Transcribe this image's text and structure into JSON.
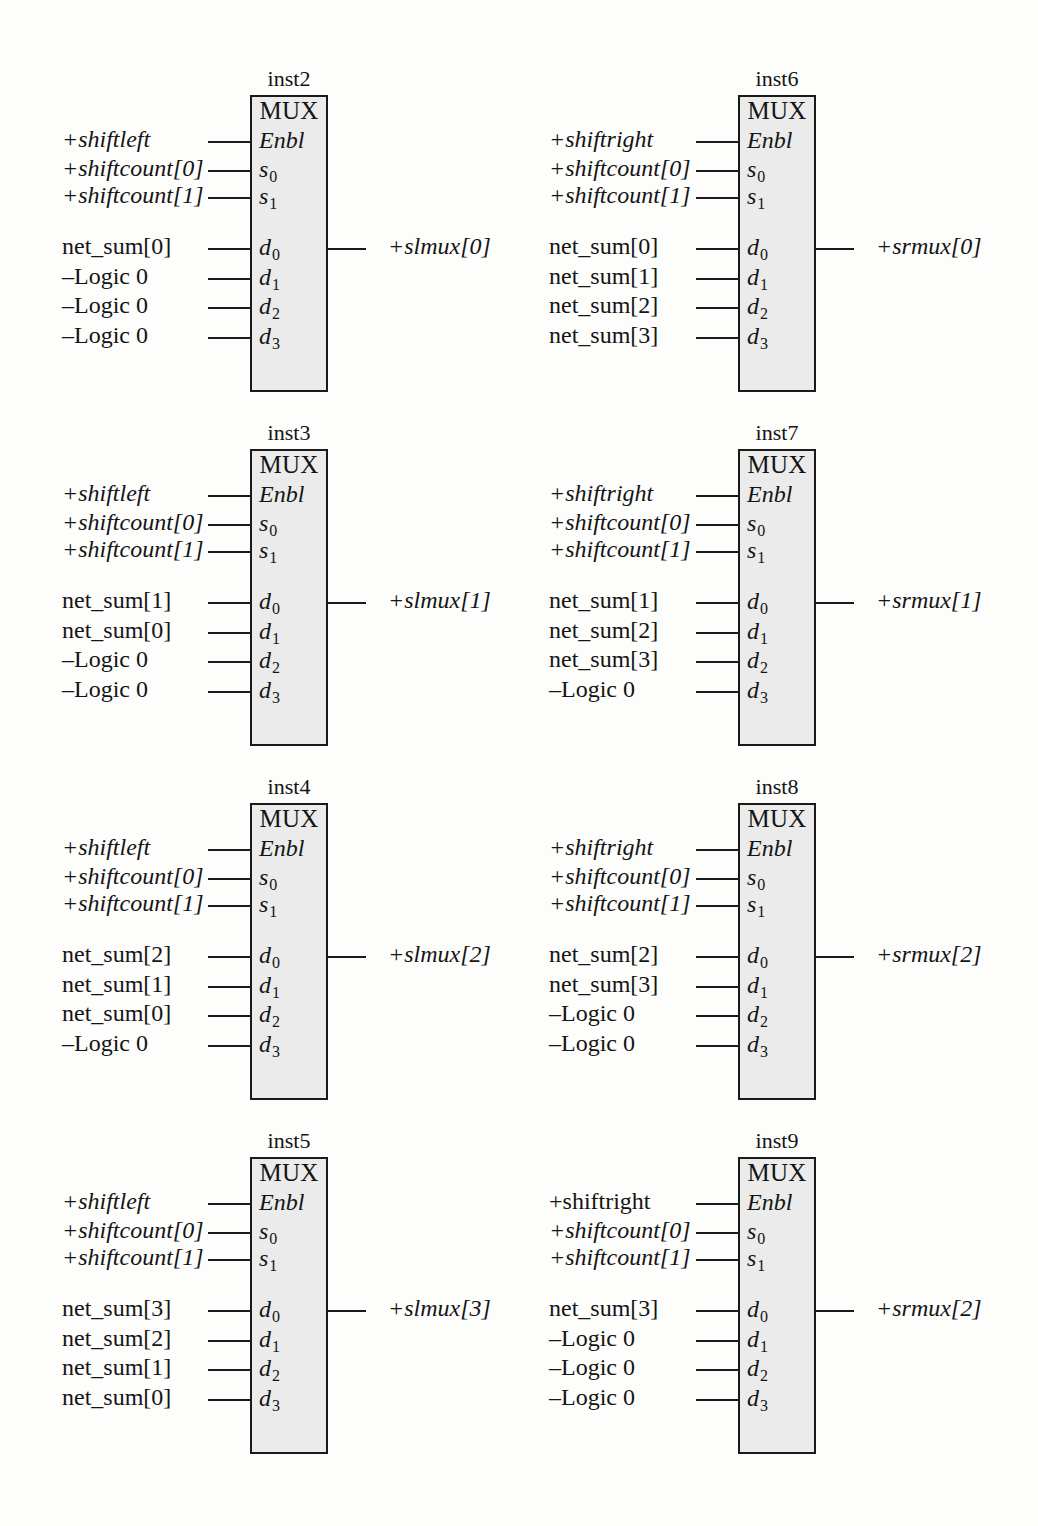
{
  "diagram": {
    "block_label": "MUX",
    "pin_names": {
      "enbl": "Enbl",
      "s0": "s",
      "s0_sub": "0",
      "s1": "s",
      "s1_sub": "1",
      "d0": "d",
      "d0_sub": "0",
      "d1": "d",
      "d1_sub": "1",
      "d2": "d",
      "d2_sub": "2",
      "d3": "d",
      "d3_sub": "3"
    },
    "colors": {
      "box_fill": "#ebebeb",
      "line": "#1a1a1a",
      "text": "#141414",
      "page_bg": "#fdfdfc"
    },
    "blocks": [
      {
        "id": "inst2",
        "instance": "inst2",
        "column": "left",
        "row": 0,
        "inputs": [
          {
            "pin": "Enbl",
            "label": "+shiftleft",
            "italic": true
          },
          {
            "pin": "s0",
            "label": "+shiftcount[0]",
            "italic": true
          },
          {
            "pin": "s1",
            "label": "+shiftcount[1]",
            "italic": true
          },
          {
            "pin": "d0",
            "label": "net_sum[0]",
            "italic": false
          },
          {
            "pin": "d1",
            "label": "–Logic 0",
            "italic": false
          },
          {
            "pin": "d2",
            "label": "–Logic 0",
            "italic": false
          },
          {
            "pin": "d3",
            "label": "–Logic 0",
            "italic": false
          }
        ],
        "output": "+slmux[0]"
      },
      {
        "id": "inst6",
        "instance": "inst6",
        "column": "right",
        "row": 0,
        "inputs": [
          {
            "pin": "Enbl",
            "label": "+shiftright",
            "italic": true
          },
          {
            "pin": "s0",
            "label": "+shiftcount[0]",
            "italic": true
          },
          {
            "pin": "s1",
            "label": "+shiftcount[1]",
            "italic": true
          },
          {
            "pin": "d0",
            "label": "net_sum[0]",
            "italic": false
          },
          {
            "pin": "d1",
            "label": "net_sum[1]",
            "italic": false
          },
          {
            "pin": "d2",
            "label": "net_sum[2]",
            "italic": false
          },
          {
            "pin": "d3",
            "label": "net_sum[3]",
            "italic": false
          }
        ],
        "output": "+srmux[0]"
      },
      {
        "id": "inst3",
        "instance": "inst3",
        "column": "left",
        "row": 1,
        "inputs": [
          {
            "pin": "Enbl",
            "label": "+shiftleft",
            "italic": true
          },
          {
            "pin": "s0",
            "label": "+shiftcount[0]",
            "italic": true
          },
          {
            "pin": "s1",
            "label": "+shiftcount[1]",
            "italic": true
          },
          {
            "pin": "d0",
            "label": "net_sum[1]",
            "italic": false
          },
          {
            "pin": "d1",
            "label": "net_sum[0]",
            "italic": false
          },
          {
            "pin": "d2",
            "label": "–Logic 0",
            "italic": false
          },
          {
            "pin": "d3",
            "label": "–Logic 0",
            "italic": false
          }
        ],
        "output": "+slmux[1]"
      },
      {
        "id": "inst7",
        "instance": "inst7",
        "column": "right",
        "row": 1,
        "inputs": [
          {
            "pin": "Enbl",
            "label": "+shiftright",
            "italic": true
          },
          {
            "pin": "s0",
            "label": "+shiftcount[0]",
            "italic": true
          },
          {
            "pin": "s1",
            "label": "+shiftcount[1]",
            "italic": true
          },
          {
            "pin": "d0",
            "label": "net_sum[1]",
            "italic": false
          },
          {
            "pin": "d1",
            "label": "net_sum[2]",
            "italic": false
          },
          {
            "pin": "d2",
            "label": "net_sum[3]",
            "italic": false
          },
          {
            "pin": "d3",
            "label": "–Logic 0",
            "italic": false
          }
        ],
        "output": "+srmux[1]"
      },
      {
        "id": "inst4",
        "instance": "inst4",
        "column": "left",
        "row": 2,
        "inputs": [
          {
            "pin": "Enbl",
            "label": "+shiftleft",
            "italic": true
          },
          {
            "pin": "s0",
            "label": "+shiftcount[0]",
            "italic": true
          },
          {
            "pin": "s1",
            "label": "+shiftcount[1]",
            "italic": true
          },
          {
            "pin": "d0",
            "label": "net_sum[2]",
            "italic": false
          },
          {
            "pin": "d1",
            "label": "net_sum[1]",
            "italic": false
          },
          {
            "pin": "d2",
            "label": "net_sum[0]",
            "italic": false
          },
          {
            "pin": "d3",
            "label": "–Logic 0",
            "italic": false
          }
        ],
        "output": "+slmux[2]"
      },
      {
        "id": "inst8",
        "instance": "inst8",
        "column": "right",
        "row": 2,
        "inputs": [
          {
            "pin": "Enbl",
            "label": "+shiftright",
            "italic": true
          },
          {
            "pin": "s0",
            "label": "+shiftcount[0]",
            "italic": true
          },
          {
            "pin": "s1",
            "label": "+shiftcount[1]",
            "italic": true
          },
          {
            "pin": "d0",
            "label": "net_sum[2]",
            "italic": false
          },
          {
            "pin": "d1",
            "label": "net_sum[3]",
            "italic": false
          },
          {
            "pin": "d2",
            "label": "–Logic 0",
            "italic": false
          },
          {
            "pin": "d3",
            "label": "–Logic 0",
            "italic": false
          }
        ],
        "output": "+srmux[2]"
      },
      {
        "id": "inst5",
        "instance": "inst5",
        "column": "left",
        "row": 3,
        "inputs": [
          {
            "pin": "Enbl",
            "label": "+shiftleft",
            "italic": true
          },
          {
            "pin": "s0",
            "label": "+shiftcount[0]",
            "italic": true
          },
          {
            "pin": "s1",
            "label": "+shiftcount[1]",
            "italic": true
          },
          {
            "pin": "d0",
            "label": "net_sum[3]",
            "italic": false
          },
          {
            "pin": "d1",
            "label": "net_sum[2]",
            "italic": false
          },
          {
            "pin": "d2",
            "label": "net_sum[1]",
            "italic": false
          },
          {
            "pin": "d3",
            "label": "net_sum[0]",
            "italic": false
          }
        ],
        "output": "+slmux[3]"
      },
      {
        "id": "inst9",
        "instance": "inst9",
        "column": "right",
        "row": 3,
        "inputs": [
          {
            "pin": "Enbl",
            "label": "+shiftright",
            "italic": false
          },
          {
            "pin": "s0",
            "label": "+shiftcount[0]",
            "italic": true
          },
          {
            "pin": "s1",
            "label": "+shiftcount[1]",
            "italic": true
          },
          {
            "pin": "d0",
            "label": "net_sum[3]",
            "italic": false
          },
          {
            "pin": "d1",
            "label": "–Logic 0",
            "italic": false
          },
          {
            "pin": "d2",
            "label": "–Logic 0",
            "italic": false
          },
          {
            "pin": "d3",
            "label": "–Logic 0",
            "italic": false
          }
        ],
        "output": "+srmux[2]"
      }
    ]
  }
}
